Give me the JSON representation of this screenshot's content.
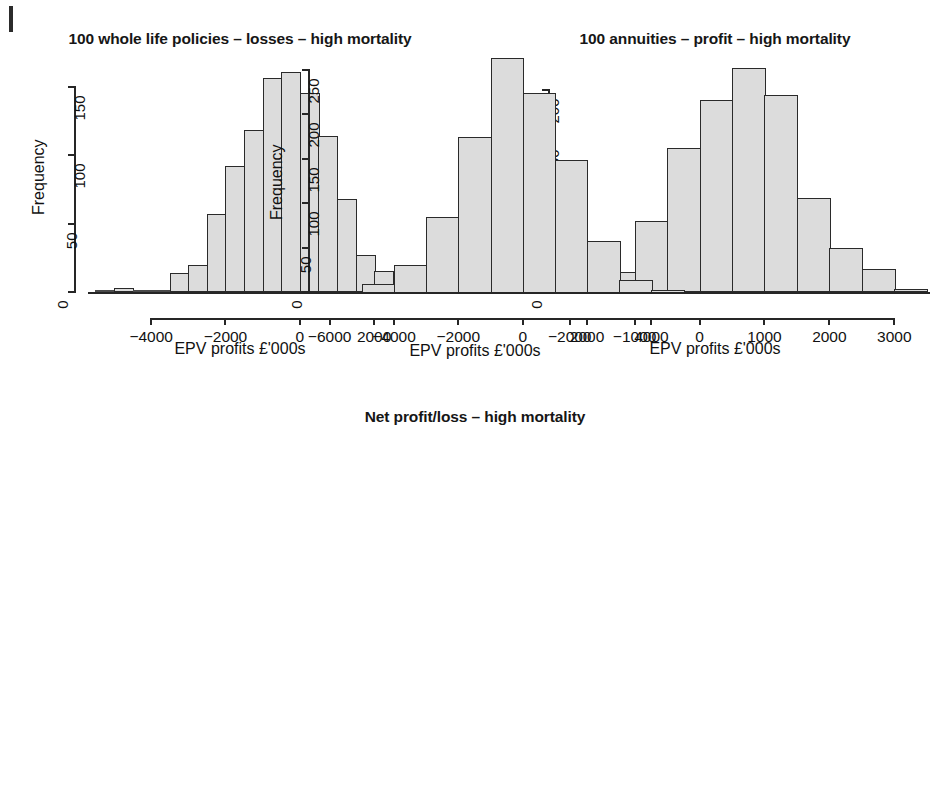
{
  "page": {
    "margin_mark": "page-edge-rule"
  },
  "axis_label_common": {
    "xlabel": "EPV profits £'000s",
    "ylabel": "Frequency"
  },
  "charts": [
    {
      "id": "whole-life-losses",
      "chart_data": {
        "type": "bar",
        "title": "100 whole life policies – losses – high mortality",
        "xlabel": "EPV profits £'000s",
        "ylabel": "Frequency",
        "binwidth": 500,
        "bin_edges": [
          -5500,
          -5000,
          -4500,
          -4000,
          -3500,
          -3000,
          -2500,
          -2000,
          -1500,
          -1000,
          -500,
          0,
          500,
          1000,
          1500,
          2000,
          2500,
          3000
        ],
        "categories": [
          "-5500",
          "-5000",
          "-4500",
          "-4000",
          "-3500",
          "-3000",
          "-2500",
          "-2000",
          "-1500",
          "-1000",
          "-500",
          "0",
          "500",
          "1000",
          "1500",
          "2000",
          "2500"
        ],
        "values": [
          0,
          3,
          0,
          0,
          14,
          20,
          57,
          92,
          118,
          156,
          161,
          145,
          114,
          68,
          27,
          15,
          11
        ],
        "xlim": [
          -5700,
          3100
        ],
        "ylim": [
          0,
          168
        ],
        "xticks": [
          -4000,
          -2000,
          0,
          2000
        ],
        "xticklabels": [
          "−4000",
          "−2000",
          "0",
          "2000"
        ],
        "yticks": [
          0,
          50,
          100,
          150
        ],
        "yticklabels": [
          "0",
          "50",
          "100",
          "150"
        ],
        "grid": false,
        "legend": "none"
      }
    },
    {
      "id": "annuities-profit",
      "chart_data": {
        "type": "bar",
        "title": "100 annuities – profit – high mortality",
        "xlabel": "EPV profits £'000s",
        "ylabel": "Frequency",
        "binwidth": 500,
        "bin_edges": [
          -2000,
          -1500,
          -1000,
          -500,
          0,
          500,
          1000,
          1500,
          2000,
          2500,
          3000,
          3500
        ],
        "categories": [
          "-2000",
          "-1500",
          "-1000",
          "-500",
          "0",
          "500",
          "1000",
          "1500",
          "2000",
          "2500",
          "3000"
        ],
        "values": [
          3,
          20,
          70,
          143,
          190,
          222,
          195,
          93,
          44,
          23,
          3
        ],
        "xlim": [
          -2150,
          3550
        ],
        "ylim": [
          0,
          232
        ],
        "xticks": [
          -2000,
          -1000,
          0,
          1000,
          2000,
          3000
        ],
        "xticklabels": [
          "−2000",
          "−1000",
          "0",
          "1000",
          "2000",
          "3000"
        ],
        "yticks": [
          0,
          50,
          100,
          150,
          200
        ],
        "yticklabels": [
          "0",
          "50",
          "100",
          "150",
          "200"
        ],
        "grid": false,
        "legend": "none"
      }
    },
    {
      "id": "net-profit-loss",
      "chart_data": {
        "type": "bar",
        "title": "Net profit/loss – high mortality",
        "xlabel": "EPV profits £'000s",
        "ylabel": "Frequency",
        "binwidth": 1000,
        "bin_edges": [
          -6000,
          -5000,
          -4000,
          -3000,
          -2000,
          -1000,
          0,
          1000,
          2000,
          3000,
          4000,
          5000
        ],
        "categories": [
          "-6000",
          "-5000",
          "-4000",
          "-3000",
          "-2000",
          "-1000",
          "0",
          "1000",
          "2000",
          "3000",
          "4000"
        ],
        "values": [
          1,
          9,
          30,
          84,
          174,
          263,
          224,
          148,
          57,
          14,
          2
        ],
        "xlim": [
          -6300,
          5200
        ],
        "ylim": [
          0,
          272
        ],
        "xticks": [
          -6000,
          -4000,
          -2000,
          0,
          2000,
          4000
        ],
        "xticklabels": [
          "−6000",
          "−4000",
          "−2000",
          "0",
          "2000",
          "4000"
        ],
        "yticks": [
          0,
          50,
          100,
          150,
          200,
          250
        ],
        "yticklabels": [
          "0",
          "50",
          "100",
          "150",
          "200",
          "250"
        ],
        "grid": false,
        "legend": "none"
      }
    }
  ]
}
